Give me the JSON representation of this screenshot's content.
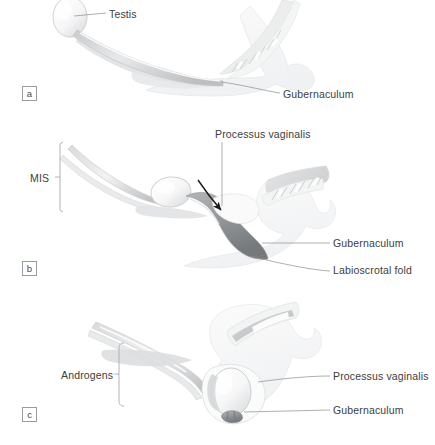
{
  "figure": {
    "background_color": "#ffffff",
    "ink_color": "#3d3d3d",
    "leader_color": "#8c8c8c"
  },
  "panels": [
    {
      "letter": "a",
      "caption": "Intra-abdominal testis with long gubernaculum",
      "labels": [
        {
          "id": "testis",
          "text": "Testis"
        },
        {
          "id": "gubernaculum_a",
          "text": "Gubernaculum"
        }
      ]
    },
    {
      "letter": "b",
      "caption": "Transinguinal migration; processus vaginalis forms",
      "labels": [
        {
          "id": "mis",
          "text": "MIS"
        },
        {
          "id": "processus_b",
          "text": "Processus vaginalis"
        },
        {
          "id": "gubernaculum_b",
          "text": "Gubernaculum"
        },
        {
          "id": "labioscrotal",
          "text": "Labioscrotal fold"
        }
      ]
    },
    {
      "letter": "c",
      "caption": "Testis descended into scrotum",
      "labels": [
        {
          "id": "androgens",
          "text": "Androgens"
        },
        {
          "id": "processus_c",
          "text": "Processus vaginalis"
        },
        {
          "id": "gubernaculum_c",
          "text": "Gubernaculum"
        }
      ]
    }
  ],
  "labels": {
    "testis": "Testis",
    "gubernaculum_a": "Gubernaculum",
    "processus_b": "Processus vaginalis",
    "mis": "MIS",
    "gubernaculum_b": "Gubernaculum",
    "labioscrotal": "Labioscrotal fold",
    "androgens": "Androgens",
    "processus_c": "Processus vaginalis",
    "gubernaculum_c": "Gubernaculum"
  },
  "panel_letters": {
    "a": "a",
    "b": "b",
    "c": "c"
  },
  "annotations": {
    "descent_arrow": "curved-arrow-down-right"
  }
}
